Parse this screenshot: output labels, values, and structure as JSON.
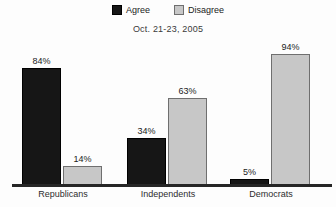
{
  "subtitle": "Oct. 21-23, 2005",
  "legend": {
    "items": [
      {
        "label": "Agree"
      },
      {
        "label": "Disagree"
      }
    ]
  },
  "chart_data": {
    "type": "bar",
    "title": "",
    "subtitle": "Oct. 21-23, 2005",
    "categories": [
      "Republicans",
      "Independents",
      "Democrats"
    ],
    "series": [
      {
        "name": "Agree",
        "color": "#161616",
        "border": "#000000",
        "values": [
          84,
          34,
          5
        ]
      },
      {
        "name": "Disagree",
        "color": "#c7c7c7",
        "border": "#6f6f6f",
        "values": [
          14,
          63,
          94
        ]
      }
    ],
    "value_label_format": "{v}%",
    "xlabel": "",
    "ylabel": "",
    "ylim": [
      0,
      100
    ],
    "grid": false,
    "legend_position": "top",
    "value_labels_shown": true,
    "axis_line_color": "#262626",
    "background_color": "#fdfdfd"
  }
}
